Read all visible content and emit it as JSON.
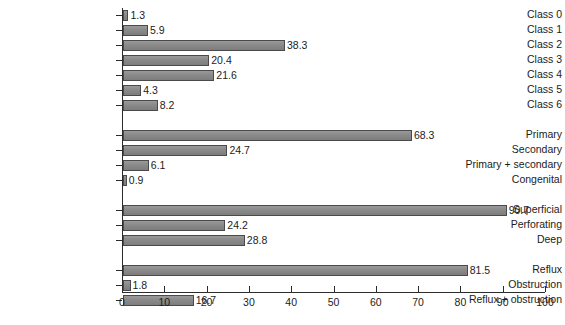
{
  "chart_data": {
    "type": "bar",
    "orientation": "horizontal",
    "title": "",
    "subtitle": "",
    "xlabel": "",
    "ylabel": "",
    "xlim": [
      0,
      100
    ],
    "ylim": null,
    "grid": false,
    "legend": null,
    "bar_color": "#8a8a8a",
    "bar_border_color": "#4a4a4a",
    "axis_color": "#2b2b2b",
    "background_color": "#ffffff",
    "xticks": [
      0,
      10,
      20,
      30,
      40,
      50,
      60,
      70,
      80,
      90,
      100
    ],
    "xtick_labels": [
      "0",
      "10",
      "20",
      "30",
      "40",
      "50",
      "60",
      "70",
      "80",
      "90",
      "100"
    ],
    "groups": [
      {
        "name": "class",
        "categories": [
          "Class 0",
          "Class 1",
          "Class 2",
          "Class 3",
          "Class 4",
          "Class 5",
          "Class 6"
        ],
        "values": [
          1.3,
          5.9,
          38.3,
          20.4,
          21.6,
          4.3,
          8.2
        ],
        "value_labels": [
          "1.3",
          "5.9",
          "38.3",
          "20.4",
          "21.6",
          "4.3",
          "8.2"
        ]
      },
      {
        "name": "aetiology",
        "categories": [
          "Primary",
          "Secondary",
          "Primary + secondary",
          "Congenital"
        ],
        "values": [
          68.3,
          24.7,
          6.1,
          0.9
        ],
        "value_labels": [
          "68.3",
          "24.7",
          "6.1",
          "0.9"
        ]
      },
      {
        "name": "anatomy",
        "categories": [
          "Superficial",
          "Perforating",
          "Deep"
        ],
        "values": [
          90.7,
          24.2,
          28.8
        ],
        "value_labels": [
          "90.7",
          "24.2",
          "28.8"
        ]
      },
      {
        "name": "pathophysiology",
        "categories": [
          "Reflux",
          "Obstruction",
          "Reflux + obstruction"
        ],
        "values": [
          81.5,
          1.8,
          16.7
        ],
        "value_labels": [
          "81.5",
          "1.8",
          "16.7"
        ]
      }
    ],
    "categories": [
      "Class 0",
      "Class 1",
      "Class 2",
      "Class 3",
      "Class 4",
      "Class 5",
      "Class 6",
      "Primary",
      "Secondary",
      "Primary + secondary",
      "Congenital",
      "Superficial",
      "Perforating",
      "Deep",
      "Reflux",
      "Obstruction",
      "Reflux + obstruction"
    ],
    "values": [
      1.3,
      5.9,
      38.3,
      20.4,
      21.6,
      4.3,
      8.2,
      68.3,
      24.7,
      6.1,
      0.9,
      90.7,
      24.2,
      28.8,
      81.5,
      1.8,
      16.7
    ]
  }
}
